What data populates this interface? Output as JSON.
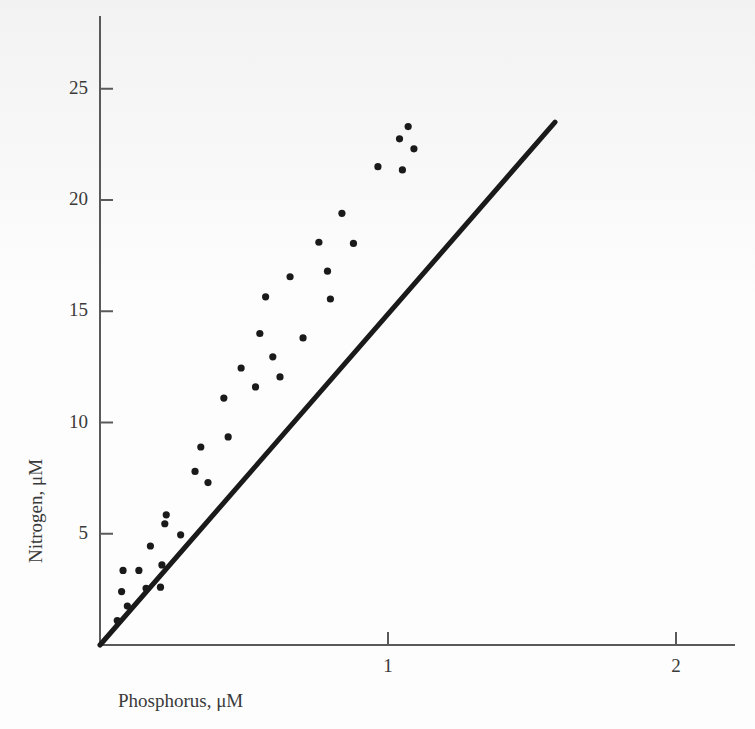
{
  "chart_data": {
    "type": "scatter",
    "title": "",
    "xlabel": "Phosphorus, μM",
    "ylabel": "Nitrogen, μM",
    "xlim": [
      0,
      2.25
    ],
    "ylim": [
      0,
      27
    ],
    "xticks": [
      1,
      2
    ],
    "xtick_labels": [
      "1",
      "2"
    ],
    "yticks": [
      5,
      10,
      15,
      20,
      25
    ],
    "ytick_labels": [
      "5",
      "10",
      "15",
      "20",
      "25"
    ],
    "grid": false,
    "legend": null,
    "series": [
      {
        "name": "samples",
        "marker": "filled-circle",
        "color": "#1a1a1a",
        "points": [
          [
            0.06,
            1.1
          ],
          [
            0.075,
            2.4
          ],
          [
            0.08,
            3.35
          ],
          [
            0.095,
            1.75
          ],
          [
            0.135,
            3.35
          ],
          [
            0.16,
            2.55
          ],
          [
            0.175,
            4.45
          ],
          [
            0.21,
            2.6
          ],
          [
            0.215,
            3.6
          ],
          [
            0.225,
            5.45
          ],
          [
            0.23,
            5.85
          ],
          [
            0.28,
            4.95
          ],
          [
            0.33,
            7.8
          ],
          [
            0.35,
            8.9
          ],
          [
            0.375,
            7.3
          ],
          [
            0.43,
            11.1
          ],
          [
            0.445,
            9.35
          ],
          [
            0.49,
            12.45
          ],
          [
            0.54,
            11.6
          ],
          [
            0.555,
            14.0
          ],
          [
            0.575,
            15.65
          ],
          [
            0.6,
            12.95
          ],
          [
            0.625,
            12.05
          ],
          [
            0.66,
            16.55
          ],
          [
            0.705,
            13.8
          ],
          [
            0.76,
            18.1
          ],
          [
            0.79,
            16.8
          ],
          [
            0.8,
            15.55
          ],
          [
            0.84,
            19.4
          ],
          [
            0.88,
            18.05
          ],
          [
            0.965,
            21.5
          ],
          [
            1.04,
            22.75
          ],
          [
            1.05,
            21.35
          ],
          [
            1.07,
            23.3
          ],
          [
            1.09,
            22.3
          ]
        ]
      }
    ],
    "fit_line": {
      "name": "regression-line",
      "color": "#1a1a1a",
      "x0": 0.0,
      "y0": 0.0,
      "x1": 1.58,
      "y1": 23.5
    }
  },
  "axes": {
    "y_axis_name": "nitrogen-axis",
    "x_axis_name": "phosphorus-axis"
  }
}
